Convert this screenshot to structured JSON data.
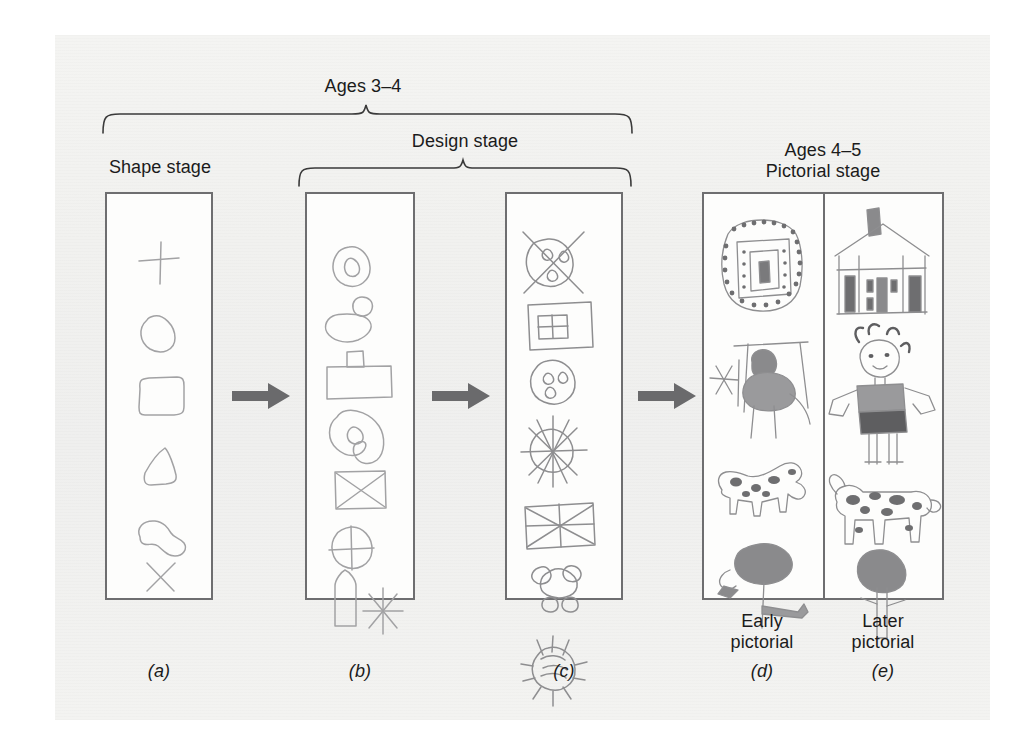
{
  "figure": {
    "title_top": "Ages 3–4",
    "brackets": [
      {
        "name": "ages-3-4",
        "label": "Ages 3–4"
      },
      {
        "name": "design-stage",
        "label": "Design stage"
      }
    ],
    "labels": {
      "shape_stage": "Shape stage",
      "design_stage": "Design stage",
      "ages_3_4": "Ages 3–4",
      "ages_4_5": "Ages 4–5",
      "pictorial_stage": "Pictorial stage",
      "early_pictorial_line1": "Early",
      "early_pictorial_line2": "pictorial",
      "later_pictorial_line1": "Later",
      "later_pictorial_line2": "pictorial"
    },
    "panel_captions": {
      "a": "(a)",
      "b": "(b)",
      "c": "(c)",
      "d": "(d)",
      "e": "(e)"
    },
    "panels": [
      {
        "key": "a",
        "caption": "(a)",
        "stage": "Shape stage",
        "drawings": [
          "cross",
          "oval",
          "rectangle",
          "triangle",
          "odd-shape",
          "x-mark"
        ]
      },
      {
        "key": "b",
        "caption": "(b)",
        "stage": "Design stage",
        "drawings": [
          "circle-in-oval",
          "blob-with-circle",
          "rectangle-with-tab",
          "spiral-blob",
          "square-with-x",
          "circle-with-cross",
          "bullet-and-asterisk"
        ]
      },
      {
        "key": "c",
        "caption": "(c)",
        "stage": "Design stage",
        "drawings": [
          "circle-with-x-and-dots",
          "rectangle-with-grid",
          "oval-with-dots",
          "sunburst-wheel",
          "rectangle-with-diagonals",
          "blob-cluster",
          "scribbled-sun"
        ]
      },
      {
        "key": "d",
        "caption": "(d)",
        "stage": "Early pictorial",
        "drawings": [
          "house",
          "person-at-table",
          "spotted-animal",
          "tree"
        ]
      },
      {
        "key": "e",
        "caption": "(e)",
        "stage": "Later pictorial",
        "drawings": [
          "house-with-chimney",
          "girl-figure",
          "spotted-cow",
          "tree"
        ]
      }
    ],
    "arrows": [
      {
        "name": "arrow-a-to-b"
      },
      {
        "name": "arrow-b-to-c"
      },
      {
        "name": "arrow-c-to-d"
      }
    ],
    "colors": {
      "page_background": "#ffffff",
      "scan_background": "#f2f2f0",
      "panel_border": "#6e6e70",
      "panel_fill": "#fdfdfc",
      "text": "#1b1b1b",
      "arrow": "#6a6a6c",
      "pencil": "#9a9a9c",
      "pencil_dark": "#7a7a7c"
    }
  }
}
